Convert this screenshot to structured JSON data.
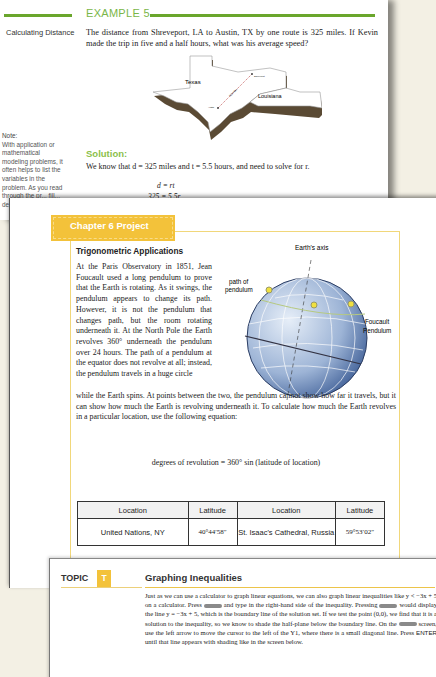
{
  "example": {
    "title": "EXAMPLE 5",
    "side_label": "Calculating Distance",
    "problem": "The distance from Shreveport, LA to Austin, TX by one route is 325 miles. If Kevin made the trip in five and a half hours, what was his average speed?",
    "map": {
      "state1": "Texas",
      "state2": "Louisiana",
      "city1": "Austin",
      "city2": "Shreveport",
      "distance_label": "325 miles"
    },
    "note": {
      "heading": "Note:",
      "text": "With application or mathematical modeling problems, it often helps to list the variables in the problem. As you read through the pr... fill... de... va..."
    },
    "solution": {
      "title": "Solution:",
      "text": "We know that  d = 325 miles and t = 5.5 hours, and need to solve for r.",
      "eq1": "d = rt",
      "eq2": "325 = 5.5r"
    }
  },
  "chapter": {
    "tab_label": "Chapter 6 Project",
    "subtitle": "Trigonometric Applications",
    "para_left": "At the Paris Observatory in 1851, Jean Foucault used a long pendulum to prove that the Earth is rotating. As it swings, the pendulum appears to change its path. However, it is not the pendulum that changes path, but the room rotating underneath it. At the North Pole the Earth revolves 360° underneath the pendulum over 24 hours. The path of a pendulum at the equator does not revolve at all; instead, the pendulum travels in a huge circle",
    "para_full": "while the Earth spins. At points between the two, the pendulum cannot show how far it travels, but it can show how much the Earth is revolving underneath it. To calculate how much the Earth revolves in a particular location, use the following equation:",
    "formula": "degrees of revolution = 360° sin (latitude of location)",
    "globe": {
      "axis_label": "Earth's axis",
      "path_label_1": "path of",
      "path_label_2": "pendulum",
      "foucault_label_1": "Foucault",
      "foucault_label_2": "Pendulum"
    },
    "table": {
      "headers": [
        "Location",
        "Latitude",
        "Location",
        "Latitude"
      ],
      "rows": [
        [
          "United Nations, NY",
          "40°44′58″",
          "St. Isaac's Cathedral, Russia",
          "59°53′02″"
        ]
      ]
    }
  },
  "topic": {
    "label": "TOPIC",
    "badge": "T",
    "title": "Graphing Inequalities",
    "para": [
      "Just as we can use a calculator to graph linear equations, we can also graph linear inequalities like  y < −3x + 5  on a calculator. Press ",
      " and type in the right-hand side of the inequality. Pressing ",
      " would display the line  y = −3x + 5, which is the boundary line of the solution set. If we test the point (0,0), we find that it is a solution to the inequality, so we know to shade the half-plane below the boundary line. On the ",
      " screen, use the left arrow to move the cursor to the left of the Y1, where there is a small diagonal line. Press ",
      "ENTER",
      " until that line appears with shading like in the screen below."
    ]
  },
  "colors": {
    "example_green": "#6aa62c",
    "chapter_yellow": "#f3c23a",
    "background": "#f3f0e4"
  }
}
